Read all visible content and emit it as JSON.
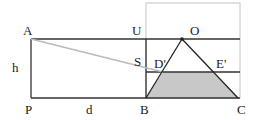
{
  "diagram": {
    "labels": {
      "A": "A",
      "P": "P",
      "h": "h",
      "d": "d",
      "U": "U",
      "S": "S",
      "B": "B",
      "O": "O",
      "D": "D'",
      "E": "E'",
      "C": "C"
    },
    "colors": {
      "line": "#222222",
      "light_line": "#bbbbbb",
      "fill": "#c8c8c8"
    }
  }
}
